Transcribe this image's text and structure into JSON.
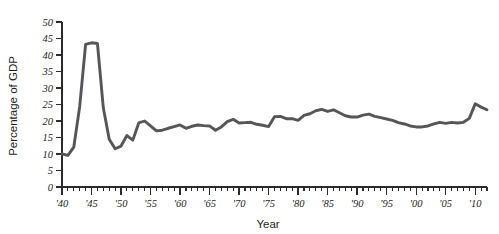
{
  "chart_data": {
    "type": "line",
    "title": "",
    "xlabel": "Year",
    "ylabel": "Percentage of GDP",
    "xlim": [
      1940,
      2012
    ],
    "ylim": [
      0,
      50
    ],
    "grid": false,
    "legend": "none",
    "line_color": "#56565a",
    "axis_color": "#2b2b2b",
    "y_ticks": [
      0,
      5,
      10,
      15,
      20,
      25,
      30,
      35,
      40,
      45,
      50
    ],
    "y_tick_labels": [
      "0",
      "5",
      "10",
      "15",
      "20",
      "25",
      "30",
      "35",
      "40",
      "45",
      "50"
    ],
    "x_ticks": [
      1940,
      1945,
      1950,
      1955,
      1960,
      1965,
      1970,
      1975,
      1980,
      1985,
      1990,
      1995,
      2000,
      2005,
      2010
    ],
    "x_tick_labels": [
      "'40",
      "'45",
      "'50",
      "'55",
      "'60",
      "'65",
      "'70",
      "'75",
      "'80",
      "'85",
      "'90",
      "'95",
      "'00",
      "'05",
      "'10"
    ],
    "x_minor_tick_step": 1,
    "x": [
      1940,
      1941,
      1942,
      1943,
      1944,
      1945,
      1946,
      1947,
      1948,
      1949,
      1950,
      1951,
      1952,
      1953,
      1954,
      1955,
      1956,
      1957,
      1958,
      1959,
      1960,
      1961,
      1962,
      1963,
      1964,
      1965,
      1966,
      1967,
      1968,
      1969,
      1970,
      1971,
      1972,
      1973,
      1974,
      1975,
      1976,
      1977,
      1978,
      1979,
      1980,
      1981,
      1982,
      1983,
      1984,
      1985,
      1986,
      1987,
      1988,
      1989,
      1990,
      1991,
      1992,
      1993,
      1994,
      1995,
      1996,
      1997,
      1998,
      1999,
      2000,
      2001,
      2002,
      2003,
      2004,
      2005,
      2006,
      2007,
      2008,
      2009,
      2010,
      2011,
      2012
    ],
    "values": [
      10.0,
      9.6,
      12.1,
      24.4,
      43.2,
      43.7,
      43.5,
      24.0,
      14.5,
      11.6,
      12.4,
      15.6,
      14.2,
      19.4,
      20.0,
      18.5,
      17.0,
      17.2,
      17.8,
      18.3,
      18.8,
      17.8,
      18.4,
      18.8,
      18.6,
      18.5,
      17.2,
      18.2,
      19.8,
      20.5,
      19.4,
      19.5,
      19.6,
      19.0,
      18.7,
      18.3,
      21.3,
      21.4,
      20.7,
      20.7,
      20.2,
      21.7,
      22.2,
      23.1,
      23.5,
      22.9,
      23.4,
      22.5,
      21.6,
      21.2,
      21.2,
      21.8,
      22.1,
      21.4,
      21.0,
      20.6,
      20.2,
      19.5,
      19.1,
      18.5,
      18.2,
      18.2,
      18.5,
      19.1,
      19.6,
      19.3,
      19.6,
      19.4,
      19.6,
      20.8,
      25.2,
      24.2,
      23.4
    ]
  },
  "axis_titles": {
    "x": "Year",
    "y": "Percentage of GDP"
  }
}
